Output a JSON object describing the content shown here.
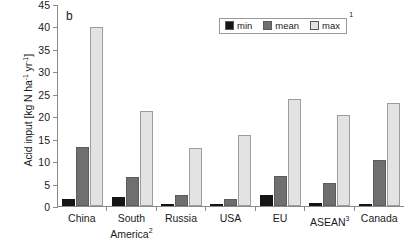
{
  "panel": {
    "letter": "b"
  },
  "legend": {
    "superscript": "1",
    "items": [
      {
        "label": "min",
        "color": "#151515"
      },
      {
        "label": "mean",
        "color": "#6f6f6f"
      },
      {
        "label": "max",
        "color": "#e3e3e3"
      }
    ]
  },
  "axis": {
    "y_title_main": "Acid input [kg N ha",
    "y_title_sup1": "-1",
    "y_title_mid": " yr",
    "y_title_sup2": "-1",
    "y_title_end": "]",
    "y_ticks": [
      0,
      5,
      10,
      15,
      20,
      25,
      30,
      35,
      40,
      45
    ]
  },
  "chart_data": {
    "type": "bar",
    "title": "b",
    "xlabel": "",
    "ylabel": "Acid input [kg N ha-1 yr-1]",
    "ylim": [
      0,
      45
    ],
    "ytick_step": 5,
    "grid": false,
    "legend_position": "top-right",
    "categories": [
      "China",
      "South America",
      "Russia",
      "USA",
      "EU",
      "ASEAN",
      "Canada"
    ],
    "category_labels": [
      {
        "line1": "China",
        "line2": "",
        "superscript": ""
      },
      {
        "line1": "South",
        "line2": "America",
        "superscript": "2"
      },
      {
        "line1": "Russia",
        "line2": "",
        "superscript": ""
      },
      {
        "line1": "USA",
        "line2": "",
        "superscript": ""
      },
      {
        "line1": "EU",
        "line2": "",
        "superscript": ""
      },
      {
        "line1": "ASEAN",
        "line2": "",
        "superscript": "3"
      },
      {
        "line1": "Canada",
        "line2": "",
        "superscript": ""
      }
    ],
    "series": [
      {
        "name": "min",
        "values": [
          1.6,
          1.9,
          0.5,
          0.3,
          2.4,
          0.7,
          0.2
        ]
      },
      {
        "name": "mean",
        "values": [
          13.2,
          6.5,
          2.4,
          1.5,
          6.7,
          5.2,
          10.2
        ]
      },
      {
        "name": "max",
        "values": [
          39.9,
          21.2,
          12.9,
          15.8,
          23.8,
          20.3,
          23.0
        ]
      }
    ]
  }
}
